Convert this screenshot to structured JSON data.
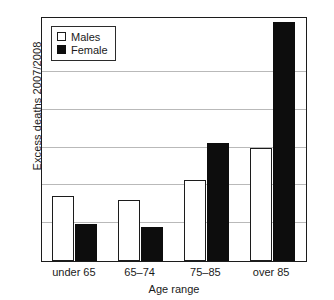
{
  "chart_data": {
    "type": "bar",
    "title": "",
    "xlabel": "Age range",
    "ylabel": "Excess deaths 2007/2008",
    "categories": [
      "under 65",
      "65–74",
      "75–85",
      "over 85"
    ],
    "series": [
      {
        "name": "Males",
        "color": "#ffffff",
        "edge": "#1c1c1c",
        "values": [
          1.72,
          1.62,
          2.14,
          2.98
        ]
      },
      {
        "name": "Female",
        "color": "#0d0d0d",
        "edge": "#0d0d0d",
        "values": [
          0.97,
          0.89,
          3.13,
          6.32
        ]
      }
    ],
    "ylim": [
      0,
      6.4
    ],
    "yticks": [
      1,
      2,
      3,
      4,
      5
    ],
    "ytick_labels": [
      "",
      "",
      "",
      "",
      ""
    ],
    "grid": true,
    "grid_axis": "y",
    "legend": {
      "position": "upper-left-inside",
      "entries": [
        {
          "label": "Males",
          "swatch": "males-swatch"
        },
        {
          "label": "Female",
          "swatch": "female-swatch"
        }
      ]
    },
    "frame": {
      "left": 41,
      "top": 17,
      "width": 266,
      "height": 245,
      "color": "#1c1c1c"
    }
  }
}
